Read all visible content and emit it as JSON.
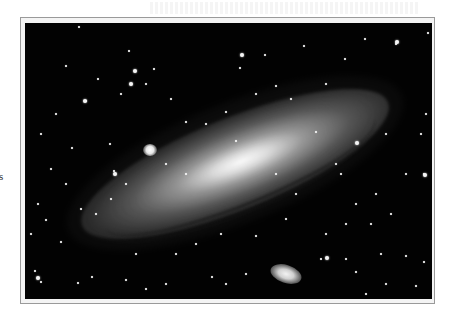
{
  "page": {
    "margin_fragment": "s"
  },
  "figure": {
    "frame_color": "#9a9a9a",
    "background_color": "#020202",
    "companions": [
      "upper-left compact companion",
      "lower-right elliptical companion"
    ]
  },
  "stars": [
    [
      53,
      3
    ],
    [
      103,
      27
    ],
    [
      72,
      55
    ],
    [
      128,
      45
    ],
    [
      214,
      44
    ],
    [
      239,
      31
    ],
    [
      278,
      22
    ],
    [
      319,
      35
    ],
    [
      339,
      15
    ],
    [
      370,
      20
    ],
    [
      402,
      9
    ],
    [
      40,
      42
    ],
    [
      60,
      77
    ],
    [
      30,
      90
    ],
    [
      15,
      110
    ],
    [
      84,
      120
    ],
    [
      46,
      124
    ],
    [
      88,
      147
    ],
    [
      12,
      180
    ],
    [
      20,
      196
    ],
    [
      5,
      210
    ],
    [
      35,
      218
    ],
    [
      9,
      247
    ],
    [
      15,
      258
    ],
    [
      52,
      259
    ],
    [
      66,
      253
    ],
    [
      100,
      256
    ],
    [
      120,
      265
    ],
    [
      140,
      260
    ],
    [
      186,
      253
    ],
    [
      200,
      260
    ],
    [
      220,
      250
    ],
    [
      295,
      235
    ],
    [
      320,
      235
    ],
    [
      355,
      230
    ],
    [
      380,
      232
    ],
    [
      398,
      238
    ],
    [
      330,
      248
    ],
    [
      340,
      270
    ],
    [
      390,
      262
    ],
    [
      360,
      260
    ],
    [
      360,
      110
    ],
    [
      380,
      150
    ],
    [
      398,
      150
    ],
    [
      350,
      170
    ],
    [
      365,
      190
    ],
    [
      345,
      200
    ],
    [
      330,
      180
    ],
    [
      320,
      200
    ],
    [
      300,
      210
    ],
    [
      260,
      195
    ],
    [
      230,
      212
    ],
    [
      195,
      210
    ],
    [
      170,
      220
    ],
    [
      150,
      230
    ],
    [
      110,
      230
    ],
    [
      250,
      150
    ],
    [
      210,
      117
    ],
    [
      180,
      100
    ],
    [
      160,
      98
    ],
    [
      140,
      140
    ],
    [
      160,
      150
    ],
    [
      290,
      108
    ],
    [
      300,
      60
    ],
    [
      265,
      75
    ],
    [
      250,
      62
    ],
    [
      230,
      70
    ],
    [
      200,
      88
    ],
    [
      85,
      175
    ],
    [
      100,
      160
    ],
    [
      70,
      190
    ],
    [
      55,
      185
    ],
    [
      400,
      90
    ],
    [
      395,
      110
    ],
    [
      310,
      140
    ],
    [
      315,
      150
    ],
    [
      270,
      170
    ],
    [
      145,
      75
    ],
    [
      120,
      60
    ],
    [
      95,
      70
    ],
    [
      25,
      145
    ],
    [
      40,
      160
    ],
    [
      140,
      290
    ],
    [
      280,
      280
    ]
  ],
  "big_stars": [
    [
      108,
      46
    ],
    [
      58,
      76
    ],
    [
      104,
      59
    ],
    [
      215,
      30
    ],
    [
      370,
      17
    ],
    [
      330,
      118
    ],
    [
      398,
      150
    ],
    [
      88,
      149
    ],
    [
      11,
      253
    ],
    [
      300,
      233
    ]
  ]
}
